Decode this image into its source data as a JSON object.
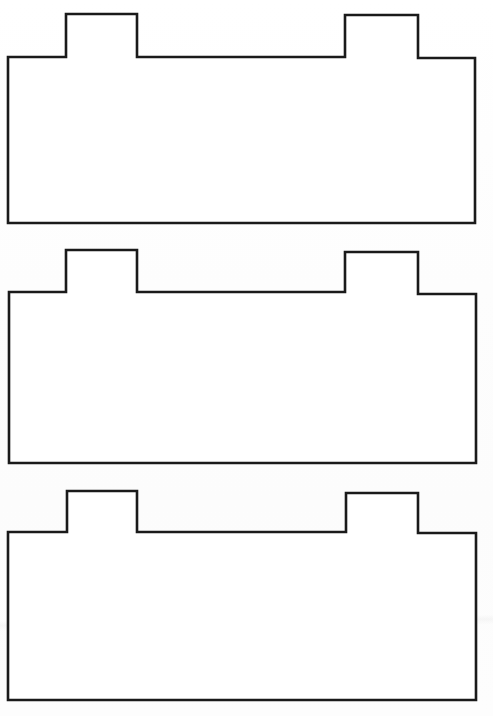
{
  "page": {
    "background_color": "#fdfdfd",
    "width": 493,
    "height": 716,
    "medium": "scanned line drawing",
    "artifact_note": "faint horizontal paper crease across lower shape"
  },
  "style": {
    "stroke_color": "#1a1a1a",
    "fill_color": "#ffffff",
    "stroke_width": 2.6
  },
  "shapes": [
    {
      "id": "shape-1",
      "name": "outlined-tabbed-rectangle-top",
      "label": "",
      "left": 8,
      "right": 475,
      "tab_top": 14,
      "shoulder": 57,
      "bottom": 223,
      "tab_one_left": 66,
      "tab_one_right": 137,
      "tab_two_left": 345,
      "tab_two_right": 418,
      "points": "8,57 66,57 66,14 137,14 137,57 345,57 345,15 418,15 418,58 475,58 475,223 8,223"
    },
    {
      "id": "shape-2",
      "name": "outlined-tabbed-rectangle-middle",
      "label": "",
      "left": 9,
      "right": 476,
      "tab_top": 250,
      "shoulder": 292,
      "bottom": 463,
      "tab_one_left": 66,
      "tab_one_right": 137,
      "tab_two_left": 345,
      "tab_two_right": 418,
      "points": "9,292 66,292 66,250 137,250 137,292 345,292 345,252 418,252 418,294 476,294 476,463 9,463"
    },
    {
      "id": "shape-3",
      "name": "outlined-tabbed-rectangle-bottom",
      "label": "",
      "left": 8,
      "right": 476,
      "tab_top": 491,
      "shoulder": 532,
      "bottom": 700,
      "tab_one_left": 67,
      "tab_one_right": 137,
      "tab_two_left": 346,
      "tab_two_right": 418,
      "points": "8,532 67,532 67,491 137,491 137,532 346,532 346,493 418,493 418,533 476,533 476,700 8,700"
    }
  ]
}
